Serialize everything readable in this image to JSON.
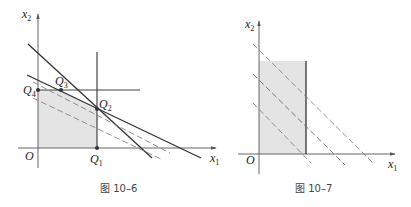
{
  "figures": [
    {
      "id": "fig-10-6",
      "caption": "图 10–6",
      "axes": {
        "x_label": "x",
        "x_sub": "1",
        "y_label": "x",
        "y_sub": "2",
        "origin": "O"
      },
      "points": [
        {
          "name": "Q",
          "sub": "1"
        },
        {
          "name": "Q",
          "sub": "2"
        },
        {
          "name": "Q",
          "sub": "3"
        },
        {
          "name": "Q",
          "sub": "4"
        }
      ],
      "shaded_region": "O-Q4-Q3-Q2-Q1",
      "fill_color": "#e4e4e4",
      "line_color": "#333333"
    },
    {
      "id": "fig-10-7",
      "caption": "图 10–7",
      "axes": {
        "x_label": "x",
        "x_sub": "1",
        "y_label": "x",
        "y_sub": "2",
        "origin": "O"
      },
      "shaded_region": "rectangle",
      "fill_color": "#e4e4e4",
      "line_color": "#333333"
    }
  ]
}
